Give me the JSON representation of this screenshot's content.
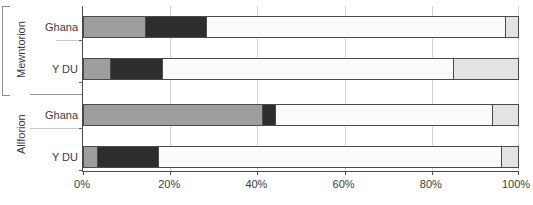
{
  "chart_data": {
    "type": "bar",
    "orientation": "horizontal",
    "stacked": true,
    "stacked_normalized": true,
    "title": "",
    "xlabel": "",
    "ylabel": "",
    "xlim": [
      0,
      100
    ],
    "xticks": [
      0,
      20,
      40,
      60,
      80,
      100
    ],
    "xtick_labels": [
      "0%",
      "20%",
      "40%",
      "60%",
      "80%",
      "100%"
    ],
    "grid": true,
    "legend": "none",
    "groups": [
      {
        "name": "Mewntorion",
        "categories": [
          "Ghana",
          "Y DU"
        ]
      },
      {
        "name": "Allforion",
        "categories": [
          "Ghana",
          "Y DU"
        ]
      }
    ],
    "categories": [
      "Ghana",
      "Y DU",
      "Ghana",
      "Y DU"
    ],
    "series": [
      {
        "name": "segment-1",
        "color": "#9e9e9e",
        "values": [
          14,
          6,
          41,
          3
        ]
      },
      {
        "name": "segment-2",
        "color": "#2e2e2e",
        "values": [
          14,
          12,
          3,
          14
        ]
      },
      {
        "name": "segment-3",
        "color": "#fbfbfb",
        "values": [
          69,
          67,
          50,
          79
        ]
      },
      {
        "name": "segment-4",
        "color": "#e3e3e3",
        "values": [
          3,
          15,
          6,
          4
        ]
      }
    ],
    "bars": [
      {
        "group": "Mewntorion",
        "category": "Ghana",
        "segments": [
          {
            "series": "segment-1",
            "value": 14,
            "color": "#9e9e9e"
          },
          {
            "series": "segment-2",
            "value": 14,
            "color": "#2e2e2e"
          },
          {
            "series": "segment-3",
            "value": 69,
            "color": "#fbfbfb"
          },
          {
            "series": "segment-4",
            "value": 3,
            "color": "#e3e3e3"
          }
        ]
      },
      {
        "group": "Mewntorion",
        "category": "Y DU",
        "segments": [
          {
            "series": "segment-1",
            "value": 6,
            "color": "#9e9e9e"
          },
          {
            "series": "segment-2",
            "value": 12,
            "color": "#2e2e2e"
          },
          {
            "series": "segment-3",
            "value": 67,
            "color": "#fbfbfb"
          },
          {
            "series": "segment-4",
            "value": 15,
            "color": "#e3e3e3"
          }
        ]
      },
      {
        "group": "Allforion",
        "category": "Ghana",
        "segments": [
          {
            "series": "segment-1",
            "value": 41,
            "color": "#9e9e9e"
          },
          {
            "series": "segment-2",
            "value": 3,
            "color": "#2e2e2e"
          },
          {
            "series": "segment-3",
            "value": 50,
            "color": "#fbfbfb"
          },
          {
            "series": "segment-4",
            "value": 6,
            "color": "#e3e3e3"
          }
        ]
      },
      {
        "group": "Allforion",
        "category": "Y DU",
        "segments": [
          {
            "series": "segment-1",
            "value": 3,
            "color": "#9e9e9e"
          },
          {
            "series": "segment-2",
            "value": 14,
            "color": "#2e2e2e"
          },
          {
            "series": "segment-3",
            "value": 79,
            "color": "#fbfbfb"
          },
          {
            "series": "segment-4",
            "value": 4,
            "color": "#e3e3e3"
          }
        ]
      }
    ]
  },
  "axis": {
    "group_labels": {
      "top": "Mewntorion",
      "bottom": "Allforion"
    },
    "row_labels": {
      "r1": "Ghana",
      "r2": "Y DU",
      "r3": "Ghana",
      "r4": "Y DU"
    },
    "xtick_labels": {
      "t0": "0%",
      "t1": "20%",
      "t2": "40%",
      "t3": "60%",
      "t4": "80%",
      "t5": "100%"
    }
  },
  "colors": {
    "segment_1": "#9e9e9e",
    "segment_2": "#2e2e2e",
    "segment_3": "#fbfbfb",
    "segment_4": "#e3e3e3",
    "axis": "#4a4a4a",
    "grid": "#d2d2d2",
    "text": "#3b3b3b"
  }
}
